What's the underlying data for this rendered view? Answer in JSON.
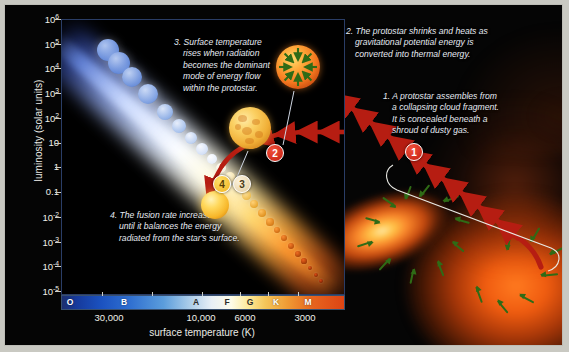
{
  "figure": {
    "background_color": "#050505",
    "mat_color": "#c9c9c2"
  },
  "axes": {
    "y_label": "luminosity (solar units)",
    "y_ticks": [
      "10⁶",
      "10⁵",
      "10⁴",
      "10³",
      "10²",
      "10",
      "1",
      "0.1",
      "10⁻²",
      "10⁻³",
      "10⁻⁴",
      "10⁻⁵"
    ],
    "x_label": "surface temperature (K)",
    "x_ticks": [
      "30,000",
      "10,000",
      "6000",
      "3000"
    ],
    "spectral_classes": [
      "O",
      "B",
      "A",
      "F",
      "G",
      "K",
      "M"
    ],
    "spectral_bar_colors": {
      "O": "#16399b",
      "B": "#2f6fd0",
      "A": "#e8eff6",
      "F": "#fdfbe8",
      "G": "#fbe99a",
      "K": "#ef9a34",
      "M": "#dd4413"
    }
  },
  "annotations": [
    {
      "number": "1",
      "badge_color": "#c41d10",
      "lines": [
        "1. A protostar assembles from",
        "a collapsing cloud fragment.",
        "It is concealed beneath a",
        "shroud of dusty gas."
      ]
    },
    {
      "number": "2",
      "badge_color": "#c41d10",
      "lines": [
        "2. The protostar shrinks and heats as",
        "gravitational potential energy is",
        "converted into thermal energy."
      ]
    },
    {
      "number": "3",
      "badge_color": "#e3cda0",
      "lines": [
        "3. Surface temperature",
        "rises when radiation",
        "becomes the dominant",
        "mode of energy flow",
        "within the protostar."
      ]
    },
    {
      "number": "4",
      "badge_color": "#f0b21c",
      "lines": [
        "4. The fusion rate increases",
        "until it balances the energy",
        "radiated from the star's surface."
      ]
    }
  ],
  "illustrations": [
    {
      "name": "contracting-protostar",
      "caption": "orange sphere with green inward arrows"
    },
    {
      "name": "convective-protostar",
      "caption": "mottled yellow convective sphere"
    },
    {
      "name": "main-sequence-star",
      "caption": "yellow main-sequence star"
    },
    {
      "name": "collapsing-cloud",
      "caption": "orange nebula with green infall arrows"
    }
  ],
  "chart_data": {
    "type": "line",
    "xlabel": "surface temperature (K)",
    "ylabel": "luminosity (solar units)",
    "x_scale": "log-reversed",
    "y_scale": "log",
    "xlim": [
      50000,
      2000
    ],
    "ylim": [
      1e-05,
      1000000.0
    ],
    "x_ticks": [
      30000,
      10000,
      6000,
      3000
    ],
    "y_ticks": [
      1000000.0,
      100000.0,
      10000.0,
      1000.0,
      100.0,
      10,
      1,
      0.1,
      0.01,
      0.001,
      0.0001,
      1e-05
    ],
    "grid": false,
    "legend": "none",
    "series": [
      {
        "name": "main sequence",
        "style": "luminous band",
        "points": [
          {
            "temp": 40000,
            "lum": 300000
          },
          {
            "temp": 20000,
            "lum": 20000
          },
          {
            "temp": 10000,
            "lum": 80
          },
          {
            "temp": 7500,
            "lum": 8
          },
          {
            "temp": 6000,
            "lum": 1.2
          },
          {
            "temp": 5000,
            "lum": 0.3
          },
          {
            "temp": 4000,
            "lum": 0.08
          },
          {
            "temp": 3000,
            "lum": 0.01
          }
        ]
      },
      {
        "name": "protostar evolutionary track",
        "style": "red arrowed curve",
        "direction": "right to left, descending then joining main sequence",
        "points": [
          {
            "temp": 2200,
            "lum": 0.02,
            "stage": "1"
          },
          {
            "temp": 2800,
            "lum": 1,
            "stage": "2"
          },
          {
            "temp": 3500,
            "lum": 2,
            "stage": "2"
          },
          {
            "temp": 4200,
            "lum": 1.5,
            "stage": "3"
          },
          {
            "temp": 5000,
            "lum": 1.1,
            "stage": "4"
          }
        ]
      }
    ],
    "stage_markers": [
      {
        "label": "1",
        "location": "in the collapsing cloud, off-diagram right"
      },
      {
        "label": "2",
        "temp": 3200,
        "lum": 2.2
      },
      {
        "label": "3",
        "temp": 4400,
        "lum": 1.3
      },
      {
        "label": "4",
        "temp": 5100,
        "lum": 1.1
      }
    ]
  }
}
